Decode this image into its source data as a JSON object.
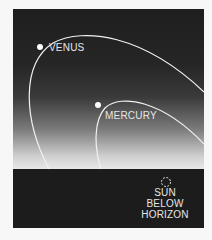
{
  "diagram": {
    "planets": [
      {
        "name": "VENUS",
        "label": "VENUS"
      },
      {
        "name": "MERCURY",
        "label": "MERCURY"
      }
    ],
    "sun": {
      "lines": [
        "SUN",
        "BELOW",
        "HORIZON"
      ]
    },
    "colors": {
      "sky_top": "#1e1e1e",
      "sky_horizon": "#e8e8e8",
      "ground": "#1c1c1c",
      "orbit": "#f2f2f2",
      "text": "#e6e6e6"
    }
  }
}
